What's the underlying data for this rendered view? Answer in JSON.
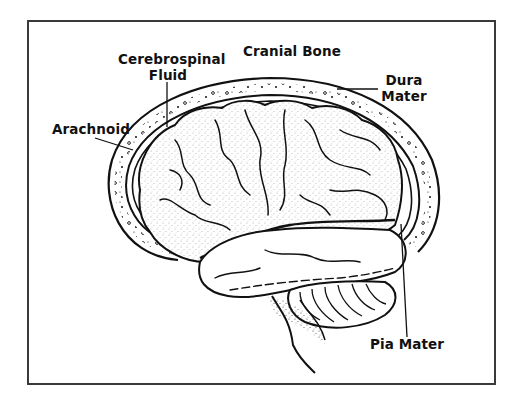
{
  "diagram": {
    "labels": {
      "cerebrospinal_fluid": {
        "line1": "Cerebrospinal",
        "line2": "Fluid"
      },
      "cranial_bone": "Cranial Bone",
      "dura_mater": {
        "line1": "Dura",
        "line2": "Mater"
      },
      "arachnoid": "Arachnoid",
      "pia_mater": "Pia Mater"
    },
    "colors": {
      "ink": "#111111",
      "frame": "#3a3a3a",
      "background": "#ffffff"
    }
  }
}
